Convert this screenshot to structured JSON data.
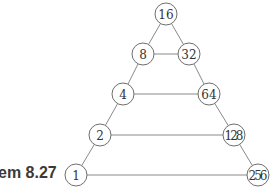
{
  "caption": "em 8.27",
  "diagram": {
    "type": "triangle-graph",
    "nodes": [
      {
        "id": "n16",
        "label": "16",
        "x": 166,
        "y": 14
      },
      {
        "id": "n8",
        "label": "8",
        "x": 143,
        "y": 54
      },
      {
        "id": "n32",
        "label": "32",
        "x": 189,
        "y": 54
      },
      {
        "id": "n4",
        "label": "4",
        "x": 123,
        "y": 94
      },
      {
        "id": "n64",
        "label": "64",
        "x": 209,
        "y": 94
      },
      {
        "id": "n2",
        "label": "2",
        "x": 100,
        "y": 135
      },
      {
        "id": "n128",
        "label": "128",
        "x": 234,
        "y": 135
      },
      {
        "id": "n1",
        "label": "1",
        "x": 76,
        "y": 175
      },
      {
        "id": "n256",
        "label": "256",
        "x": 258,
        "y": 175
      }
    ],
    "edges": [
      [
        "n16",
        "n8"
      ],
      [
        "n16",
        "n32"
      ],
      [
        "n8",
        "n32"
      ],
      [
        "n8",
        "n4"
      ],
      [
        "n32",
        "n64"
      ],
      [
        "n4",
        "n64"
      ],
      [
        "n4",
        "n2"
      ],
      [
        "n64",
        "n128"
      ],
      [
        "n2",
        "n128"
      ],
      [
        "n2",
        "n1"
      ],
      [
        "n128",
        "n256"
      ],
      [
        "n1",
        "n256"
      ]
    ],
    "node_radius": 11
  }
}
